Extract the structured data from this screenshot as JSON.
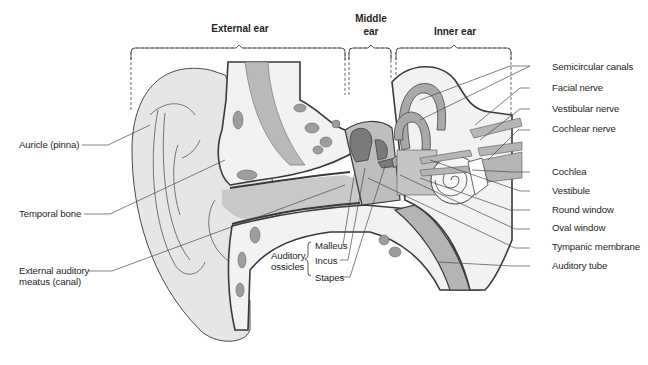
{
  "figure": {
    "regions": {
      "external": "External ear",
      "middle_line1": "Middle",
      "middle_line2": "ear",
      "inner": "Inner ear"
    },
    "left_labels": {
      "auricle": "Auricle (pinna)",
      "temporal_bone": "Temporal bone",
      "eam_line1": "External auditory",
      "eam_line2": "meatus (canal)"
    },
    "ossicles": {
      "group_line1": "Auditory",
      "group_line2": "ossicles",
      "malleus": "Malleus",
      "incus": "Incus",
      "stapes": "Stapes"
    },
    "right_labels": [
      "Semicircular canals",
      "Facial nerve",
      "Vestibular nerve",
      "Cochlear nerve",
      "Cochlea",
      "Vestibule",
      "Round window",
      "Oval window",
      "Tympanic membrane",
      "Auditory tube"
    ],
    "colors": {
      "outline": "#3a3a3a",
      "skin": "#e6e6e6",
      "canal": "#c9c9c9",
      "bone": "#f2f2f2",
      "dark": "#8c8c8c",
      "text": "#231f20"
    }
  }
}
